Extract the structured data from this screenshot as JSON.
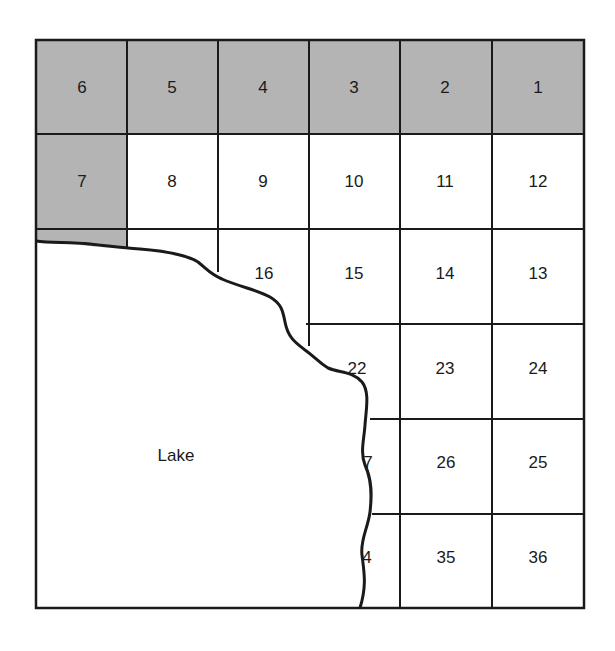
{
  "map": {
    "type": "township-section-grid",
    "colors": {
      "shaded": "#b4b4b4",
      "unshaded": "#ffffff",
      "line": "#1a1a1a",
      "text": "#1a1a1a"
    },
    "lake_label": "Lake",
    "sections": [
      {
        "row": 0,
        "col": 0,
        "label": "6",
        "shaded": true
      },
      {
        "row": 0,
        "col": 1,
        "label": "5",
        "shaded": true
      },
      {
        "row": 0,
        "col": 2,
        "label": "4",
        "shaded": true
      },
      {
        "row": 0,
        "col": 3,
        "label": "3",
        "shaded": true
      },
      {
        "row": 0,
        "col": 4,
        "label": "2",
        "shaded": true
      },
      {
        "row": 0,
        "col": 5,
        "label": "1",
        "shaded": true
      },
      {
        "row": 1,
        "col": 0,
        "label": "7",
        "shaded": true
      },
      {
        "row": 1,
        "col": 1,
        "label": "8",
        "shaded": false
      },
      {
        "row": 1,
        "col": 2,
        "label": "9",
        "shaded": false
      },
      {
        "row": 1,
        "col": 3,
        "label": "10",
        "shaded": false
      },
      {
        "row": 1,
        "col": 4,
        "label": "11",
        "shaded": false
      },
      {
        "row": 1,
        "col": 5,
        "label": "12",
        "shaded": false
      },
      {
        "row": 2,
        "col": 2,
        "label": "16",
        "shaded": false
      },
      {
        "row": 2,
        "col": 3,
        "label": "15",
        "shaded": false
      },
      {
        "row": 2,
        "col": 4,
        "label": "14",
        "shaded": false
      },
      {
        "row": 2,
        "col": 5,
        "label": "13",
        "shaded": false
      },
      {
        "row": 3,
        "col": 3,
        "label": "22",
        "shaded": false
      },
      {
        "row": 3,
        "col": 4,
        "label": "23",
        "shaded": false
      },
      {
        "row": 3,
        "col": 5,
        "label": "24",
        "shaded": false
      },
      {
        "row": 4,
        "col": 3,
        "label": "7",
        "shaded": false,
        "partial": true
      },
      {
        "row": 4,
        "col": 4,
        "label": "26",
        "shaded": false
      },
      {
        "row": 4,
        "col": 5,
        "label": "25",
        "shaded": false
      },
      {
        "row": 5,
        "col": 3,
        "label": "4",
        "shaded": false,
        "partial": true
      },
      {
        "row": 5,
        "col": 4,
        "label": "35",
        "shaded": false
      },
      {
        "row": 5,
        "col": 5,
        "label": "36",
        "shaded": false
      }
    ]
  }
}
